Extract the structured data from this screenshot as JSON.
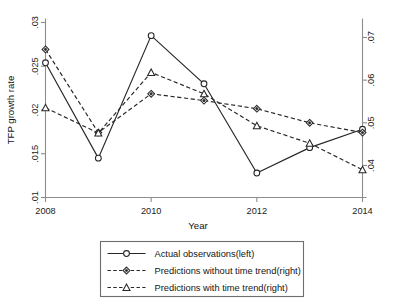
{
  "chart_data": {
    "type": "line",
    "title": "",
    "xlabel": "Year",
    "ylabel": "TFP growth rate",
    "ylabel_right": "",
    "x": [
      2008,
      2009,
      2010,
      2011,
      2012,
      2013,
      2014
    ],
    "xtick_labels": [
      "2008",
      "2010",
      "2012",
      "2014"
    ],
    "xticks": [
      2008,
      2010,
      2012,
      2014
    ],
    "xlim": [
      2008,
      2014
    ],
    "ylim_left": [
      0.01,
      0.03
    ],
    "ytick_labels_left": [
      ".01",
      ".015",
      ".02",
      ".025",
      ".03"
    ],
    "yticks_left": [
      0.01,
      0.015,
      0.02,
      0.025,
      0.03
    ],
    "ylim_right": [
      0.0325,
      0.0735
    ],
    "ytick_labels_right": [
      ".04",
      ".05",
      ".06",
      ".07"
    ],
    "yticks_right": [
      0.04,
      0.05,
      0.06,
      0.07
    ],
    "grid": false,
    "legend_position": "below-center",
    "series": [
      {
        "name": "Actual observations(left)",
        "axis": "left",
        "marker": "circle",
        "linestyle": "solid",
        "values": [
          0.0254,
          0.0145,
          0.0285,
          0.023,
          0.0128,
          0.0157,
          0.0178
        ]
      },
      {
        "name": "Predictions without time trend(right)",
        "axis": "right",
        "marker": "diamond",
        "linestyle": "dashed",
        "values": [
          0.0672,
          0.0477,
          0.0568,
          0.0552,
          0.0533,
          0.05,
          0.0477
        ]
      },
      {
        "name": "Predictions with time trend(right)",
        "axis": "right",
        "marker": "triangle",
        "linestyle": "dashed",
        "values": [
          0.0535,
          0.0476,
          0.0618,
          0.0568,
          0.0493,
          0.0452,
          0.039
        ]
      }
    ]
  },
  "axes": {
    "y_left_title": "TFP growth rate",
    "x_title": "Year"
  },
  "legend": {
    "entries": [
      {
        "label": "Actual observations(left)",
        "marker": "circle",
        "style": "solid"
      },
      {
        "label": "Predictions without time trend(right)",
        "marker": "diamond",
        "style": "dashed"
      },
      {
        "label": "Predictions with time trend(right)",
        "marker": "triangle",
        "style": "dashed"
      }
    ]
  },
  "colors": {
    "line": "#262626",
    "axis": "#8c8c8c",
    "background": "#ffffff",
    "legend_border": "#6e6e6e"
  }
}
